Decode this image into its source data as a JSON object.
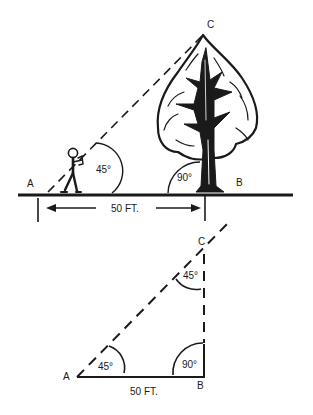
{
  "diagram": {
    "colors": {
      "ink": "#1a1a1a",
      "background": "#ffffff"
    },
    "scene": {
      "points": {
        "A": "A",
        "B": "B",
        "C": "C"
      },
      "angle_at_observer": "45°",
      "angle_at_tree_base": "90°",
      "distance_label": "50 FT.",
      "elements": [
        "observer-figure",
        "tree",
        "ground-line",
        "sight-line",
        "distance-dimension"
      ]
    },
    "triangle": {
      "points": {
        "A": "A",
        "B": "B",
        "C": "C"
      },
      "angle_A": "45°",
      "angle_B": "90°",
      "angle_C": "45°",
      "base_label": "50 FT."
    }
  }
}
